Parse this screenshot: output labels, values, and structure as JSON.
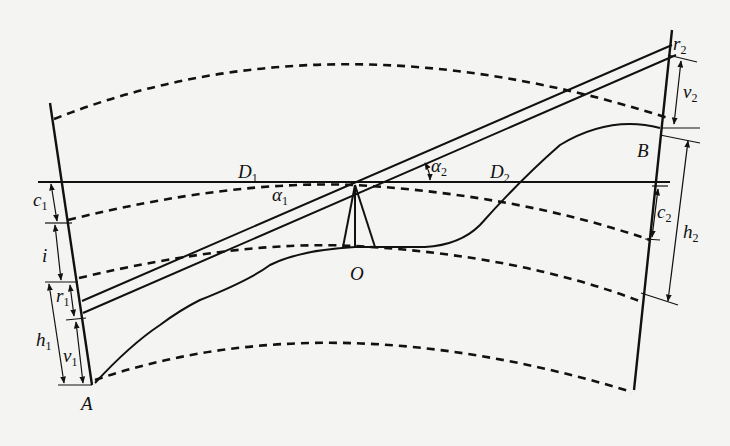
{
  "diagram": {
    "type": "trigonometric-leveling-schematic",
    "points": {
      "A": "A",
      "B": "B",
      "O": "O"
    },
    "labels": {
      "D1": {
        "main": "D",
        "sub": "1"
      },
      "D2": {
        "main": "D",
        "sub": "2"
      },
      "alpha1": {
        "main": "α",
        "sub": "1"
      },
      "alpha2": {
        "main": "α",
        "sub": "2"
      },
      "c1": {
        "main": "c",
        "sub": "1"
      },
      "c2": {
        "main": "c",
        "sub": "2"
      },
      "i": {
        "main": "i"
      },
      "r1": {
        "main": "r",
        "sub": "1"
      },
      "r2": {
        "main": "r",
        "sub": "2"
      },
      "h1": {
        "main": "h",
        "sub": "1"
      },
      "h2": {
        "main": "h",
        "sub": "2"
      },
      "v1": {
        "main": "v",
        "sub": "1"
      },
      "v2": {
        "main": "v",
        "sub": "2"
      }
    },
    "colors": {
      "ink": "#111111",
      "paper": "#f4f4f2"
    }
  }
}
